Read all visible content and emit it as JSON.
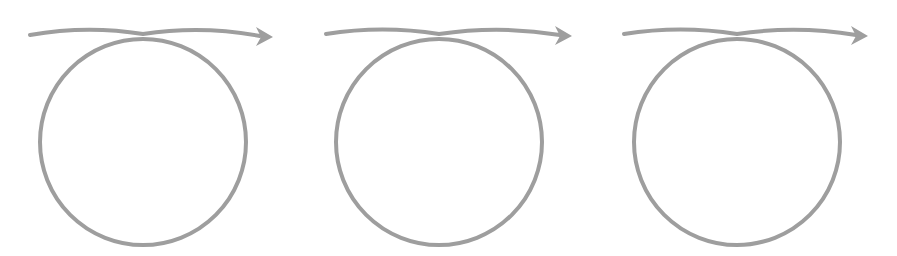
{
  "diagram": {
    "title": "Three loop-and-arrow figures",
    "stroke_color": "#9e9e9e",
    "background_color": "#ffffff",
    "stroke_width": 4,
    "figures": [
      {
        "label": "loop-arrow-1",
        "circle": {
          "cx": 143,
          "cy": 142,
          "r": 103
        },
        "arrow": {
          "start": [
            30,
            35
          ],
          "cross": [
            143,
            34
          ],
          "end": [
            260,
            36
          ],
          "tip": [
            273,
            37
          ]
        }
      },
      {
        "label": "loop-arrow-2",
        "circle": {
          "cx": 439,
          "cy": 142,
          "r": 103
        },
        "arrow": {
          "start": [
            326,
            34
          ],
          "cross": [
            439,
            34
          ],
          "end": [
            560,
            35
          ],
          "tip": [
            572,
            36
          ]
        }
      },
      {
        "label": "loop-arrow-3",
        "circle": {
          "cx": 737,
          "cy": 142,
          "r": 103
        },
        "arrow": {
          "start": [
            624,
            34
          ],
          "cross": [
            737,
            34
          ],
          "end": [
            856,
            35
          ],
          "tip": [
            868,
            36
          ]
        }
      }
    ]
  }
}
